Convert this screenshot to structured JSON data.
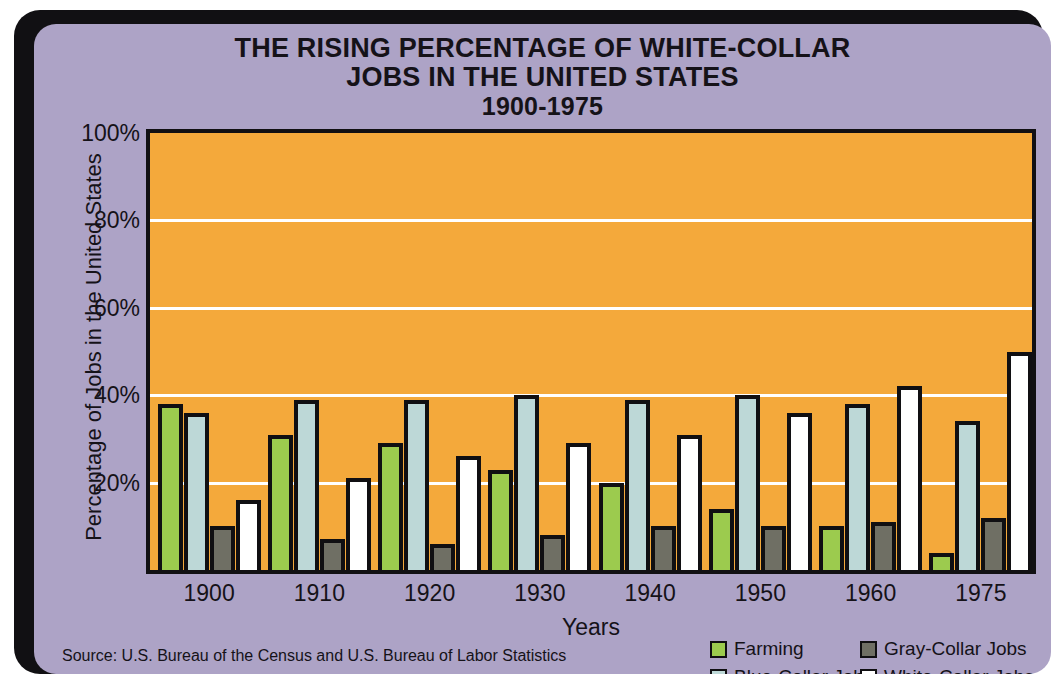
{
  "title": {
    "line1": "THE RISING PERCENTAGE OF WHITE-COLLAR",
    "line2": "JOBS IN THE UNITED STATES",
    "line3": "1900-1975"
  },
  "axes": {
    "y_title": "Percentage of Jobs in the United States",
    "x_title": "Years"
  },
  "source": {
    "text": "Source: U.S. Bureau of the Census and U.S. Bureau of Labor Statistics"
  },
  "legend": {
    "items": [
      {
        "label": "Farming",
        "key": "farming",
        "color": "#9ccb4e"
      },
      {
        "label": "Gray-Collar Jobs",
        "key": "graycollar",
        "color": "#6f6f64"
      },
      {
        "label": "Blue-Collar Jobs",
        "key": "bluecollar",
        "color": "#bdd8d7"
      },
      {
        "label": "White-Collar Jobs",
        "key": "whitecollar",
        "color": "#ffffff"
      }
    ]
  },
  "colors": {
    "plot_background": "#f4a93b",
    "poster_background": "#ada3c6",
    "frame": "#111013",
    "gridline": "#ffffff",
    "farming": "#9ccb4e",
    "blue_collar": "#bdd8d7",
    "gray_collar": "#6f6f64",
    "white_collar": "#ffffff"
  },
  "chart_data": {
    "type": "bar",
    "title": "THE RISING PERCENTAGE OF WHITE-COLLAR JOBS IN THE UNITED STATES 1900-1975",
    "xlabel": "Years",
    "ylabel": "Percentage of Jobs in the United States",
    "categories": [
      "1900",
      "1910",
      "1920",
      "1930",
      "1940",
      "1950",
      "1960",
      "1975"
    ],
    "ylim": [
      0,
      100
    ],
    "yticks": [
      20,
      40,
      60,
      80,
      100
    ],
    "ytick_labels": [
      "20%",
      "40%",
      "60%",
      "80%",
      "100%"
    ],
    "grid": true,
    "legend_position": "bottom-right",
    "series": [
      {
        "name": "Farming",
        "key": "farming",
        "color": "#9ccb4e",
        "values": [
          38,
          31,
          29,
          23,
          20,
          14,
          10,
          4
        ]
      },
      {
        "name": "Blue-Collar Jobs",
        "key": "bluecollar",
        "color": "#bdd8d7",
        "values": [
          36,
          39,
          39,
          40,
          39,
          40,
          38,
          34
        ]
      },
      {
        "name": "Gray-Collar Jobs",
        "key": "graycollar",
        "color": "#6f6f64",
        "values": [
          10,
          7,
          6,
          8,
          10,
          10,
          11,
          12
        ]
      },
      {
        "name": "White-Collar Jobs",
        "key": "whitecollar",
        "color": "#ffffff",
        "values": [
          16,
          21,
          26,
          29,
          31,
          36,
          42,
          50
        ]
      }
    ]
  }
}
